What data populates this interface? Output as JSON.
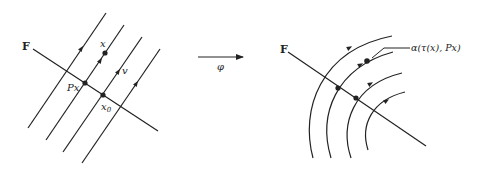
{
  "left_diagram": {
    "transversal_label": "F",
    "point_px_label": "Px",
    "point_x_label": "x",
    "point_x0_label": "x",
    "point_x0_sub": "0",
    "vector_label": "v"
  },
  "map_arrow": {
    "label": "φ"
  },
  "right_diagram": {
    "transversal_label": "F",
    "callout_label": "α(τ(x),  Px)"
  },
  "colors": {
    "ink": "#222222",
    "background": "#ffffff"
  }
}
